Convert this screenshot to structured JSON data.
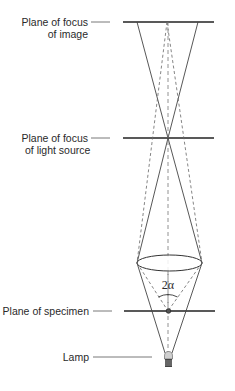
{
  "diagram": {
    "title": "",
    "labels": {
      "image_plane": {
        "line1": "Plane of focus",
        "line2": "of image"
      },
      "light_plane": {
        "line1": "Plane of focus",
        "line2": "of light source"
      },
      "specimen_plane": "Plane of specimen",
      "lamp": "Lamp",
      "angle": "2α"
    },
    "colors": {
      "plane_line": "#222222",
      "ray_solid": "#444444",
      "ray_dashed": "#666666",
      "leader": "#555555",
      "text": "#2a2a2a"
    }
  }
}
